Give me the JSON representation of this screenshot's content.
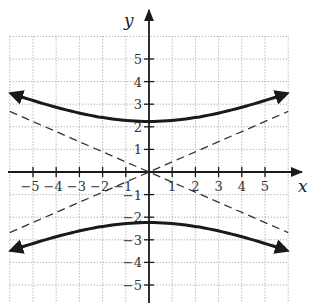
{
  "chart_data": {
    "type": "line",
    "title": "",
    "xlabel": "x",
    "ylabel": "y",
    "xlim": [
      -6,
      6
    ],
    "ylim": [
      -5.8,
      6
    ],
    "grid": true,
    "grid_style": "dotted",
    "x_ticks": [
      -5,
      -4,
      -3,
      -2,
      -1,
      1,
      2,
      3,
      4,
      5
    ],
    "y_ticks": [
      -5,
      -4,
      -3,
      -2,
      -1,
      1,
      2,
      3,
      4,
      5
    ],
    "x_tick_labels": [
      "−5",
      "−4",
      "−3",
      "−2",
      "−1",
      "1",
      "2",
      "3",
      "4",
      "5"
    ],
    "y_tick_labels": [
      "−5",
      "−4",
      "−3",
      "−2",
      "−1",
      "1",
      "2",
      "3",
      "4",
      "5"
    ],
    "series": [
      {
        "name": "hyperbola upper branch",
        "style": "solid-thick-with-arrows",
        "equation": "y^2/5 - x^2/25 = 1",
        "x": [
          -6,
          -5,
          -4,
          -3,
          -2,
          -1,
          0,
          1,
          2,
          3,
          4,
          5,
          6
        ],
        "values": [
          3.49,
          3.16,
          2.86,
          2.61,
          2.41,
          2.28,
          2.24,
          2.28,
          2.41,
          2.61,
          2.86,
          3.16,
          3.49
        ]
      },
      {
        "name": "hyperbola lower branch",
        "style": "solid-thick-with-arrows",
        "equation": "y^2/5 - x^2/25 = 1",
        "x": [
          -6,
          -5,
          -4,
          -3,
          -2,
          -1,
          0,
          1,
          2,
          3,
          4,
          5,
          6
        ],
        "values": [
          -3.49,
          -3.16,
          -2.86,
          -2.61,
          -2.41,
          -2.28,
          -2.24,
          -2.28,
          -2.41,
          -2.61,
          -2.86,
          -3.16,
          -3.49
        ]
      },
      {
        "name": "asymptote positive slope",
        "style": "dashed",
        "equation": "y = 0.447x",
        "x": [
          -6,
          6
        ],
        "values": [
          -2.68,
          2.68
        ]
      },
      {
        "name": "asymptote negative slope",
        "style": "dashed",
        "equation": "y = -0.447x",
        "x": [
          -6,
          6
        ],
        "values": [
          2.68,
          -2.68
        ]
      }
    ],
    "colors": {
      "curve": "#1a1a1a",
      "asymptote": "#333333",
      "grid": "#9a9a9a",
      "axis": "#1a1a1a"
    }
  }
}
